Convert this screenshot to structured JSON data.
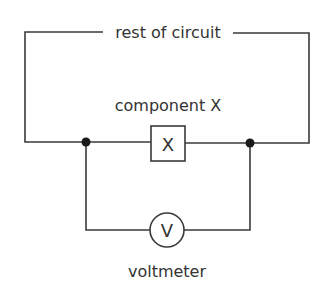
{
  "diagram": {
    "type": "circuit",
    "labels": {
      "top": "rest of circuit",
      "component": "component X",
      "component_symbol": "X",
      "meter_symbol": "V",
      "meter": "voltmeter"
    },
    "colors": {
      "wire": "#3a3a3a",
      "text": "#333333",
      "node": "#1a1a1a",
      "background": "#ffffff"
    },
    "elements": [
      {
        "id": "component-x",
        "kind": "component box",
        "symbol": "X",
        "connection": "series in main loop"
      },
      {
        "id": "voltmeter",
        "kind": "meter circle",
        "symbol": "V",
        "connection": "parallel across component X"
      },
      {
        "id": "junction-left",
        "kind": "junction node"
      },
      {
        "id": "junction-right",
        "kind": "junction node"
      }
    ]
  }
}
